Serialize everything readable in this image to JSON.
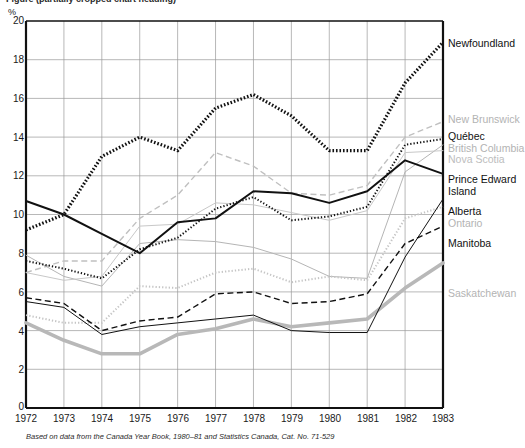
{
  "caption": {
    "text": "Figure (partially cropped chart heading)"
  },
  "axes": {
    "y_unit": "%",
    "y_ticks": [
      "20",
      "18",
      "16",
      "14",
      "12",
      "10",
      "8",
      "6",
      "4",
      "2",
      "0"
    ],
    "x_ticks": [
      "1972",
      "1973",
      "1974",
      "1975",
      "1976",
      "1977",
      "1978",
      "1979",
      "1980",
      "1981",
      "1982",
      "1983"
    ]
  },
  "footnote": "Based on data from the Canada Year Book, 1980–81 and Statistics Canada, Cat. No. 71-529",
  "labels": {
    "newfoundland": "Newfoundland",
    "new_brunswick": "New Brunswick",
    "quebec": "Québec",
    "british_columbia": "British Columbia",
    "nova_scotia": "Nova Scotia",
    "prince_edward_island_1": "Prince Edward",
    "prince_edward_island_2": "Island",
    "alberta": "Alberta",
    "ontario": "Ontario",
    "manitoba": "Manitoba",
    "saskatchewan": "Saskatchewan"
  },
  "chart_data": {
    "type": "line",
    "xlabel": "",
    "ylabel": "%",
    "xlim": [
      1972,
      1983
    ],
    "ylim": [
      0,
      20
    ],
    "y_tick_step": 2,
    "grid": true,
    "legend_position": "right-inline",
    "x": [
      1972,
      1973,
      1974,
      1975,
      1976,
      1977,
      1978,
      1979,
      1980,
      1981,
      1982,
      1983
    ],
    "series": [
      {
        "name": "Newfoundland",
        "color": "#111111",
        "style": "thick-dotted",
        "label_color": "#111111",
        "values": [
          9.2,
          10.0,
          13.0,
          14.0,
          13.3,
          15.5,
          16.2,
          15.1,
          13.3,
          13.3,
          16.8,
          18.9
        ]
      },
      {
        "name": "New Brunswick",
        "color": "#c0c0c0",
        "style": "dashed",
        "label_color": "#b8b8b8",
        "values": [
          7.0,
          7.6,
          7.6,
          9.8,
          11.0,
          13.2,
          12.5,
          11.1,
          11.0,
          11.5,
          14.0,
          14.8
        ]
      },
      {
        "name": "Québec",
        "color": "#111111",
        "style": "dotted",
        "label_color": "#111111",
        "values": [
          7.6,
          7.2,
          6.7,
          8.2,
          8.8,
          10.3,
          10.9,
          9.7,
          9.9,
          10.4,
          13.6,
          13.9
        ]
      },
      {
        "name": "British Columbia",
        "color": "#b5b5b5",
        "style": "solid-thin",
        "label_color": "#b8b8b8",
        "values": [
          7.9,
          6.8,
          6.3,
          8.5,
          8.7,
          8.6,
          8.3,
          7.7,
          6.8,
          6.7,
          12.2,
          13.6
        ]
      },
      {
        "name": "Nova Scotia",
        "color": "#c8c8c8",
        "style": "solid-thin",
        "label_color": "#bdbdbd",
        "values": [
          7.0,
          6.6,
          6.8,
          9.4,
          9.5,
          10.6,
          10.5,
          10.1,
          9.7,
          10.2,
          13.2,
          13.3
        ]
      },
      {
        "name": "Prince Edward Island",
        "color": "#111111",
        "style": "solid-bold",
        "label_color": "#111111",
        "values": [
          10.7,
          10.0,
          9.0,
          8.0,
          9.6,
          9.8,
          11.2,
          11.1,
          10.6,
          11.2,
          12.8,
          12.1
        ]
      },
      {
        "name": "Alberta",
        "color": "#111111",
        "style": "solid-thin",
        "label_color": "#111111",
        "values": [
          5.5,
          5.2,
          3.8,
          4.2,
          4.4,
          4.6,
          4.8,
          4.0,
          3.9,
          3.9,
          7.8,
          10.8
        ]
      },
      {
        "name": "Ontario",
        "color": "#c5c5c5",
        "style": "dotted",
        "label_color": "#bdbdbd",
        "values": [
          4.8,
          4.4,
          4.4,
          6.3,
          6.2,
          7.0,
          7.2,
          6.5,
          6.8,
          6.6,
          9.8,
          10.4
        ]
      },
      {
        "name": "Manitoba",
        "color": "#111111",
        "style": "dashed",
        "label_color": "#111111",
        "values": [
          5.7,
          5.4,
          4.0,
          4.5,
          4.7,
          5.9,
          6.0,
          5.4,
          5.5,
          5.9,
          8.5,
          9.4
        ]
      },
      {
        "name": "Saskatchewan",
        "color": "#b8b8b8",
        "style": "thick-solid",
        "label_color": "#bdbdbd",
        "values": [
          4.4,
          3.5,
          2.8,
          2.8,
          3.8,
          4.1,
          4.6,
          4.2,
          4.4,
          4.6,
          6.2,
          7.5
        ]
      }
    ]
  }
}
